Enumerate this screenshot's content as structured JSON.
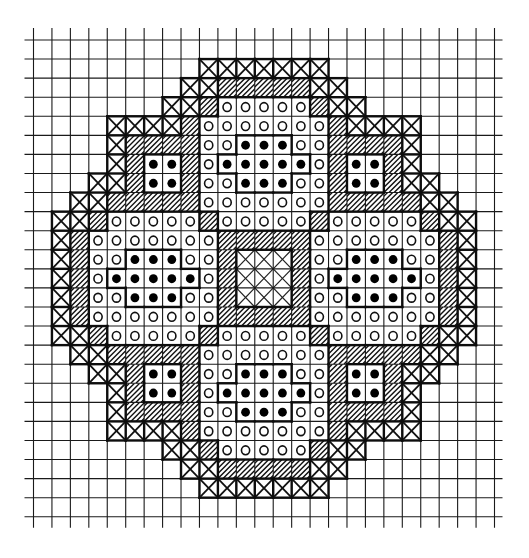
{
  "diagram": {
    "type": "cross-stitch / needlepoint chart",
    "grid": {
      "cols": 25,
      "rows": 25,
      "origin_x": 33.5,
      "origin_y": 40,
      "cell_w": 18.44,
      "cell_h": 19.07,
      "line_extend_top": 12,
      "line_extend_bottom": 11,
      "line_extend_left": 9,
      "line_extend_right": 8
    },
    "legend": {
      ".": "empty",
      "X": "cross-stitch",
      "/": "diagonal-hatch",
      "o": "open-circle",
      "*": "filled-dot",
      "#": "center-lattice"
    },
    "pattern": [
      ".........................",
      ".........XXXXXXX.........",
      "........XX/////XX........",
      ".......XX/ooooo/XX.......",
      "....XXXX/ooooooo/XXXX....",
      "....X////oo***oo////X....",
      "....X/**/o*****o/**/X....",
      "...XX/**/oo***oo/**/XX...",
      "..XX/////ooooooo/////XX..",
      ".XX/ooooo/ooooo/ooooo/XX.",
      ".X/ooooooo/////ooooooo/X.",
      ".X/oo***oo/###/oo***oo/X.",
      ".X/o*****o/###/o*****o/X.",
      ".X/oo***oo/###/oo***oo/X.",
      ".X/ooooooo/////ooooooo/X.",
      ".XX/ooooo/ooooo/ooooo/XX.",
      "..XX/////ooooooo/////XX..",
      "...XX/**/oo***oo/**/XX...",
      "....X/**/o*****o/**/X....",
      "....X////oo***oo////X....",
      "....XXXX/ooooooo/XXXX....",
      ".......XX/ooooo/XX.......",
      "........XX/////XX........",
      ".........XXXXXXX.........",
      "........................."
    ],
    "colors": {
      "ink": "#111111",
      "paper": "#ffffff"
    }
  }
}
